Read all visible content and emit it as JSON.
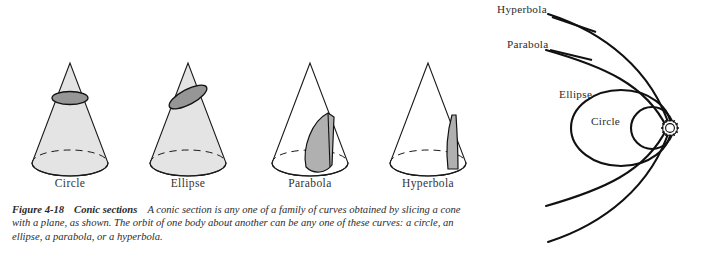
{
  "figure": {
    "number": "Figure 4-18",
    "title": "Conic sections",
    "caption_line1": "A conic section is any one of a family of curves obtained by slicing a",
    "caption_line2": "cone with a plane, as shown. The orbit of one body about another can be any one of these curves: a",
    "caption_line3": "circle, an ellipse, a parabola, or a hyperbola."
  },
  "cones": [
    {
      "label": "Circle",
      "slice": "horizontal-plane",
      "shaded": true,
      "section_fill": "#8f8f8f"
    },
    {
      "label": "Ellipse",
      "slice": "tilted-plane",
      "shaded": true,
      "section_fill": "#8f8f8f"
    },
    {
      "label": "Parabola",
      "slice": "plane-parallel-to-side",
      "shaded": false,
      "section_fill": "#b3b3b3"
    },
    {
      "label": "Hyperbola",
      "slice": "vertical-plane",
      "shaded": false,
      "section_fill": "#b3b3b3"
    }
  ],
  "orbits": {
    "focus_symbol": "sun-symbol",
    "labels": [
      {
        "name": "Hyperbola",
        "text": "Hyperbola"
      },
      {
        "name": "Parabola",
        "text": "Parabola"
      },
      {
        "name": "Ellipse",
        "text": "Ellipse"
      },
      {
        "name": "Circle",
        "text": "Circle"
      }
    ]
  },
  "colors": {
    "ink": "#1a1a1a",
    "text": "#2b2b2b",
    "cone_fill": "#e2e2e2",
    "section_fill": "#9a9a9a",
    "background": "#ffffff"
  }
}
